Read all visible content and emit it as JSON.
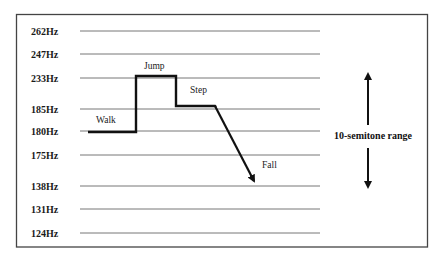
{
  "diagram": {
    "title": "",
    "frequency_levels": [
      {
        "label": "262Hz",
        "y": 31
      },
      {
        "label": "247Hz",
        "y": 54
      },
      {
        "label": "233Hz",
        "y": 78
      },
      {
        "label": "185Hz",
        "y": 109
      },
      {
        "label": "180Hz",
        "y": 131
      },
      {
        "label": "175Hz",
        "y": 155
      },
      {
        "label": "138Hz",
        "y": 186
      },
      {
        "label": "131Hz",
        "y": 209
      },
      {
        "label": "124Hz",
        "y": 233
      }
    ],
    "segments": [
      {
        "label": "Walk",
        "level": "180Hz"
      },
      {
        "label": "Jump",
        "level": "233Hz"
      },
      {
        "label": "Step",
        "level": "185Hz"
      },
      {
        "label": "Fall",
        "level": "138Hz"
      }
    ],
    "range_annotation": "10-semitone range"
  }
}
